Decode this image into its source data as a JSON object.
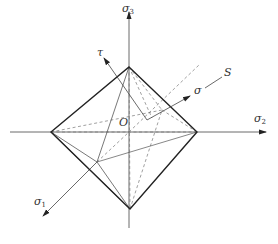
{
  "diagram": {
    "labels": {
      "sigma3_axis": {
        "symbol": "σ",
        "sub": "3"
      },
      "sigma2_axis": {
        "symbol": "σ",
        "sub": "2"
      },
      "sigma1_axis": {
        "symbol": "σ",
        "sub": "1"
      },
      "tau": "τ",
      "sigma": "σ",
      "S": "S",
      "origin": "O"
    },
    "colors": {
      "solid_edge": "#222222",
      "thin_line": "#555555",
      "dashed_line": "#777777",
      "background": "#ffffff"
    },
    "vertices": {
      "top": [
        129,
        67
      ],
      "bottom": [
        130,
        209
      ],
      "left": [
        51,
        132
      ],
      "right": [
        197,
        132
      ],
      "front": [
        97,
        162
      ],
      "origin": [
        129,
        132
      ]
    }
  }
}
